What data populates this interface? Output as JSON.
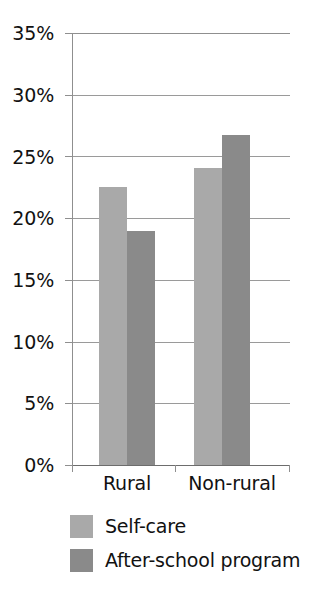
{
  "chart_data": {
    "type": "bar",
    "title": "",
    "xlabel": "",
    "ylabel": "",
    "categories": [
      "Rural",
      "Non-rural"
    ],
    "series": [
      {
        "name": "Self-care",
        "values": [
          22.5,
          24.1
        ],
        "color": "#a9a9a9"
      },
      {
        "name": "After-school program",
        "values": [
          19.0,
          26.7
        ],
        "color": "#8a8a8a"
      }
    ],
    "ylim": [
      0,
      35
    ],
    "ytick_values": [
      35,
      30,
      25,
      20,
      15,
      10,
      5,
      0
    ],
    "ytick_labels": [
      "35%",
      "30%",
      "25%",
      "20%",
      "15%",
      "10%",
      "5%",
      "0%"
    ],
    "grid": true,
    "legend_position": "bottom-left",
    "value_unit": "percent"
  },
  "axis": {
    "ticks": [
      {
        "label": "35%"
      },
      {
        "label": "30%"
      },
      {
        "label": "25%"
      },
      {
        "label": "20%"
      },
      {
        "label": "15%"
      },
      {
        "label": "10%"
      },
      {
        "label": "5%"
      },
      {
        "label": "0%"
      }
    ],
    "categories": [
      {
        "label": "Rural"
      },
      {
        "label": "Non-rural"
      }
    ]
  },
  "legend": {
    "items": [
      {
        "label": "Self-care",
        "color": "#a9a9a9"
      },
      {
        "label": "After-school program",
        "color": "#8a8a8a"
      }
    ]
  }
}
